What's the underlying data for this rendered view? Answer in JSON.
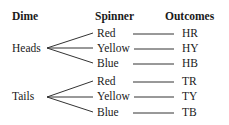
{
  "headers": {
    "dime": "Dime",
    "spinner": "Spinner",
    "outcomes": "Outcomes"
  },
  "tree": [
    {
      "dime": "Heads",
      "branches": [
        {
          "spinner": "Red",
          "outcome": "HR"
        },
        {
          "spinner": "Yellow",
          "outcome": "HY"
        },
        {
          "spinner": "Blue",
          "outcome": "HB"
        }
      ]
    },
    {
      "dime": "Tails",
      "branches": [
        {
          "spinner": "Red",
          "outcome": "TR"
        },
        {
          "spinner": "Yellow",
          "outcome": "TY"
        },
        {
          "spinner": "Blue",
          "outcome": "TB"
        }
      ]
    }
  ],
  "colors": {
    "text": "#1a1a1a",
    "line": "#333333",
    "background": "#ffffff"
  }
}
